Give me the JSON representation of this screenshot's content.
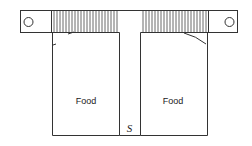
{
  "diagram": {
    "labels": {
      "left_compartment": "Food",
      "right_compartment": "Food",
      "separator": "S"
    },
    "colors": {
      "stroke": "#333333",
      "background": "#ffffff"
    }
  }
}
